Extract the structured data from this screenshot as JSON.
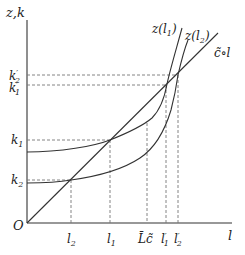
{
  "diagram": {
    "axes": {
      "y_label": "z,k",
      "x_label": "l",
      "origin_label": "O"
    },
    "y_ticks": [
      {
        "id": "k2p",
        "label": "k",
        "sub": "2",
        "prime": "′",
        "y": 75
      },
      {
        "id": "k1p",
        "label": "k",
        "sub": "1",
        "prime": "′",
        "y": 85
      },
      {
        "id": "k1",
        "label": "k",
        "sub": "1",
        "prime": "",
        "y": 140
      },
      {
        "id": "k2",
        "label": "k",
        "sub": "2",
        "prime": "",
        "y": 180
      }
    ],
    "x_ticks": [
      {
        "id": "l2",
        "label": "l",
        "sub": "2",
        "prime": "",
        "x": 71
      },
      {
        "id": "l1",
        "label": "l",
        "sub": "1",
        "prime": "",
        "x": 110
      },
      {
        "id": "Lc",
        "label": "L̄c̃",
        "sub": "",
        "prime": "",
        "x": 147
      },
      {
        "id": "l1p",
        "label": "l",
        "sub": "1",
        "prime": "′",
        "x": 166
      },
      {
        "id": "l2p",
        "label": "l",
        "sub": "2",
        "prime": "′",
        "x": 178
      }
    ],
    "curves": {
      "z_l1": {
        "label": "z(l",
        "sub": "1",
        "close": ")"
      },
      "z_l2": {
        "label": "z(l",
        "sub": "2",
        "close": ")"
      },
      "line": {
        "label": "c̃∘l"
      }
    }
  }
}
